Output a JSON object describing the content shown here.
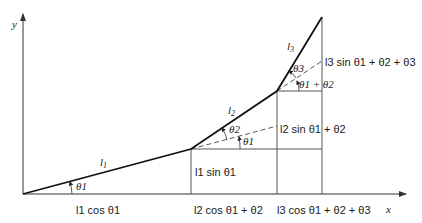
{
  "diagram": {
    "axes": {
      "x_label": "x",
      "y_label": "y"
    },
    "links": [
      {
        "name": "l1",
        "label_main": "l",
        "label_sub": "1"
      },
      {
        "name": "l2",
        "label_main": "l",
        "label_sub": "2"
      },
      {
        "name": "l3",
        "label_main": "l",
        "label_sub": "3"
      }
    ],
    "angles": {
      "theta1_base": "θ1",
      "theta1_joint2": "θ1",
      "theta2": "θ2",
      "theta1_plus_theta2": "θ1 + θ2",
      "theta3": "θ3"
    },
    "projections": {
      "l1_cos": "l1 cos θ1",
      "l2_cos": "l2 cos θ1 + θ2",
      "l3_cos": "l3 cos θ1 + θ2 + θ3",
      "l1_sin": "l1 sin θ1",
      "l2_sin": "l2 sin θ1 + θ2",
      "l3_sin": "l3 sin θ1 + θ2 + θ3"
    },
    "colors": {
      "line": "#111111",
      "background": "#ffffff"
    }
  }
}
